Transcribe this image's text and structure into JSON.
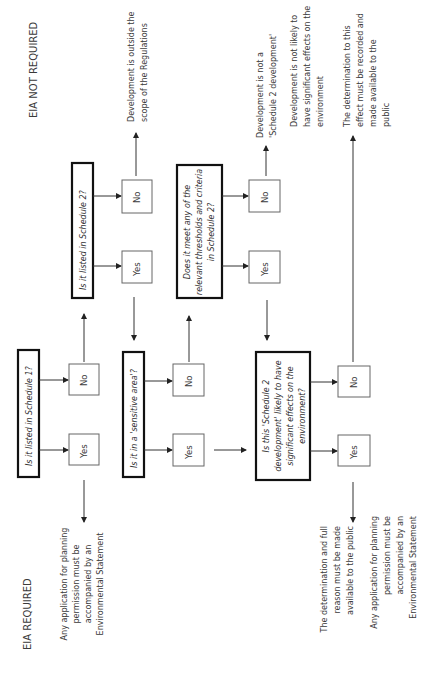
{
  "diagram": {
    "orientation": "rotated-90-ccw",
    "headings": {
      "not_required": "EIA NOT REQUIRED",
      "required": "EIA REQUIRED"
    },
    "questions": {
      "schedule1": "Is it listed in Schedule 1?",
      "schedule2": "Is it listed in Schedule 2?",
      "sensitive": "Is it in a 'sensitive area'?",
      "thresholds": [
        "Does it meet any of the",
        "relevant thresholds and criteria",
        "in Schedule 2?"
      ],
      "significant": [
        "Is this 'Schedule 2",
        "development' likely to have",
        "significant effects on the",
        "environment?"
      ]
    },
    "answers": {
      "yes": "Yes",
      "no": "No"
    },
    "outcomes": {
      "outside_scope": [
        "Development is outside the",
        "scope of the Regulations"
      ],
      "not_schedule2": [
        "Development is not a",
        "'Schedule 2 development'"
      ],
      "not_likely": [
        "Development is not likely to",
        "have significant effects on the",
        "environment"
      ],
      "determination_effect": [
        "The determination to this",
        "effect must be recorded and",
        "made available to the",
        "public"
      ],
      "application_es_1": [
        "Any application for planning",
        "permission must be",
        "accompanied by an",
        "Environmental Statement"
      ],
      "determination_full": [
        "The determination and full",
        "reason must be made",
        "available to the public"
      ],
      "application_es_2": [
        "Any application for planning",
        "permission must be",
        "accompanied by an",
        "Environmental Statement"
      ]
    },
    "colors": {
      "question_border": "#111111",
      "answer_border": "#666666",
      "text": "#3a3a3a"
    }
  }
}
